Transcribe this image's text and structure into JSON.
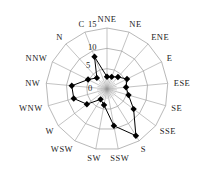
{
  "chart_data": {
    "type": "radar",
    "title": "",
    "directions": [
      "C",
      "NNE",
      "NE",
      "ENE",
      "E",
      "ESE",
      "SE",
      "SSE",
      "S",
      "SSW",
      "SW",
      "WSW",
      "W",
      "WNW",
      "NW",
      "NNW",
      "N"
    ],
    "values": [
      8.5,
      3.0,
      3.2,
      4.0,
      5.5,
      4.7,
      5.5,
      8.2,
      13.5,
      9.2,
      4.0,
      3.0,
      6.2,
      8.5,
      8.7,
      5.2,
      3.7
    ],
    "radial_ticks": [
      0,
      5,
      10,
      15
    ],
    "rmax": 15,
    "grid": true,
    "legend": null,
    "marker": "diamond",
    "line_color": "#000000",
    "grid_color": "#9a9a9a"
  }
}
